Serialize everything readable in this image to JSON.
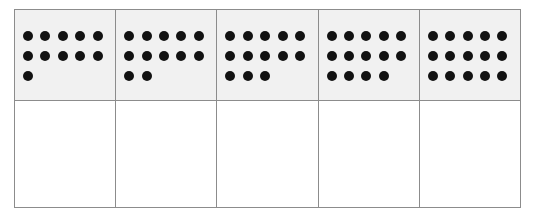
{
  "worksheet": {
    "title": "Dot arrays grid",
    "description": "Five-column two-row table; top row cells contain shaded panels of black dots, bottom row cells are blank",
    "columns": 5,
    "rows": 2,
    "grid_border_color": "#8c8c8c",
    "panel_fill_color": "#f1f1f1",
    "dot_color": "#121212",
    "page_background": "#ffffff"
  },
  "chart_data": {
    "type": "table",
    "columns": [
      "1",
      "2",
      "3",
      "4",
      "5"
    ],
    "rows": [
      {
        "name": "dot-array-row",
        "cells": [
          {
            "total": 11,
            "dot_rows": [
              5,
              5,
              1
            ]
          },
          {
            "total": 12,
            "dot_rows": [
              5,
              5,
              2
            ]
          },
          {
            "total": 13,
            "dot_rows": [
              5,
              5,
              3
            ]
          },
          {
            "total": 14,
            "dot_rows": [
              5,
              5,
              4
            ]
          },
          {
            "total": 15,
            "dot_rows": [
              5,
              5,
              5
            ]
          }
        ]
      },
      {
        "name": "answer-row",
        "cells": [
          {
            "total": 0,
            "dot_rows": []
          },
          {
            "total": 0,
            "dot_rows": []
          },
          {
            "total": 0,
            "dot_rows": []
          },
          {
            "total": 0,
            "dot_rows": []
          },
          {
            "total": 0,
            "dot_rows": []
          }
        ]
      }
    ]
  }
}
